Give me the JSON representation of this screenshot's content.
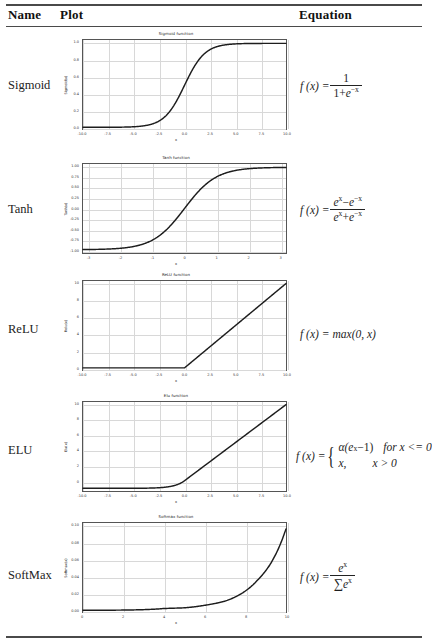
{
  "table": {
    "headers": {
      "name": "Name",
      "plot": "Plot",
      "equation": "Equation"
    }
  },
  "rows": [
    {
      "name": "Sigmoid",
      "equation_text": "f(x) = 1 / (1 + e^-x)",
      "chart": {
        "type": "line",
        "title": "Sigmoid function",
        "xlabel": "x",
        "ylabel": "Sigmoid(x)",
        "xlim": [
          -10,
          10
        ],
        "ylim": [
          -0.02,
          1.04
        ],
        "xticks": [
          "-10.0",
          "-7.5",
          "-5.0",
          "-2.5",
          "0.0",
          "2.5",
          "5.0",
          "7.5",
          "10.0"
        ],
        "xtickvals": [
          -10,
          -7.5,
          -5,
          -2.5,
          0,
          2.5,
          5,
          7.5,
          10
        ],
        "yticks": [
          "0.0",
          "0.2",
          "0.4",
          "0.6",
          "0.8",
          "1.0"
        ],
        "ytickvals": [
          0,
          0.2,
          0.4,
          0.6,
          0.8,
          1.0
        ],
        "grid": true,
        "legend": "none",
        "formula": "sigmoid",
        "points": [
          {
            "x": -10,
            "y": 4.54e-05
          },
          {
            "x": -8,
            "y": 0.000335
          },
          {
            "x": -6,
            "y": 0.00247
          },
          {
            "x": -5,
            "y": 0.00669
          },
          {
            "x": -4,
            "y": 0.01799
          },
          {
            "x": -3,
            "y": 0.04743
          },
          {
            "x": -2.5,
            "y": 0.07586
          },
          {
            "x": -2,
            "y": 0.1192
          },
          {
            "x": -1.5,
            "y": 0.18243
          },
          {
            "x": -1,
            "y": 0.26894
          },
          {
            "x": -0.5,
            "y": 0.37754
          },
          {
            "x": 0,
            "y": 0.5
          },
          {
            "x": 0.5,
            "y": 0.62246
          },
          {
            "x": 1,
            "y": 0.73106
          },
          {
            "x": 1.5,
            "y": 0.81757
          },
          {
            "x": 2,
            "y": 0.8808
          },
          {
            "x": 2.5,
            "y": 0.92414
          },
          {
            "x": 3,
            "y": 0.95257
          },
          {
            "x": 4,
            "y": 0.98201
          },
          {
            "x": 5,
            "y": 0.99331
          },
          {
            "x": 6,
            "y": 0.99753
          },
          {
            "x": 8,
            "y": 0.99966
          },
          {
            "x": 10,
            "y": 0.99995
          }
        ]
      }
    },
    {
      "name": "Tanh",
      "equation_text": "f(x) = (e^x - e^-x) / (e^x + e^-x)",
      "chart": {
        "type": "line",
        "title": "Tanh function",
        "xlabel": "x",
        "ylabel": "Tanh(x)",
        "xlim": [
          -3.2,
          3.2
        ],
        "ylim": [
          -1.08,
          1.08
        ],
        "xticks": [
          "-3",
          "-2",
          "-1",
          "0",
          "1",
          "2",
          "3"
        ],
        "xtickvals": [
          -3,
          -2,
          -1,
          0,
          1,
          2,
          3
        ],
        "yticks": [
          "-1.00",
          "-0.75",
          "-0.50",
          "-0.25",
          "0.00",
          "0.25",
          "0.50",
          "0.75",
          "1.00"
        ],
        "ytickvals": [
          -1,
          -0.75,
          -0.5,
          -0.25,
          0,
          0.25,
          0.5,
          0.75,
          1
        ],
        "grid": true,
        "legend": "none",
        "formula": "tanh",
        "points": [
          {
            "x": -3.2,
            "y": -0.99668
          },
          {
            "x": -3,
            "y": -0.99505
          },
          {
            "x": -2.5,
            "y": -0.98661
          },
          {
            "x": -2,
            "y": -0.96403
          },
          {
            "x": -1.5,
            "y": -0.90515
          },
          {
            "x": -1.25,
            "y": -0.84829
          },
          {
            "x": -1,
            "y": -0.76159
          },
          {
            "x": -0.75,
            "y": -0.63515
          },
          {
            "x": -0.5,
            "y": -0.46212
          },
          {
            "x": -0.25,
            "y": -0.24492
          },
          {
            "x": 0,
            "y": 0
          },
          {
            "x": 0.25,
            "y": 0.24492
          },
          {
            "x": 0.5,
            "y": 0.46212
          },
          {
            "x": 0.75,
            "y": 0.63515
          },
          {
            "x": 1,
            "y": 0.76159
          },
          {
            "x": 1.25,
            "y": 0.84829
          },
          {
            "x": 1.5,
            "y": 0.90515
          },
          {
            "x": 2,
            "y": 0.96403
          },
          {
            "x": 2.5,
            "y": 0.98661
          },
          {
            "x": 3,
            "y": 0.99505
          },
          {
            "x": 3.2,
            "y": 0.99668
          }
        ]
      }
    },
    {
      "name": "ReLU",
      "equation_text": "f(x) = max(0, x)",
      "chart": {
        "type": "line",
        "title": "ReLU function",
        "xlabel": "x",
        "ylabel": "Relu(x)",
        "xlim": [
          -10,
          10
        ],
        "ylim": [
          -0.25,
          10.3
        ],
        "xticks": [
          "-10.0",
          "-7.5",
          "-5.0",
          "-2.5",
          "0.0",
          "2.5",
          "5.0",
          "7.5",
          "10.0"
        ],
        "xtickvals": [
          -10,
          -7.5,
          -5,
          -2.5,
          0,
          2.5,
          5,
          7.5,
          10
        ],
        "yticks": [
          "0",
          "2",
          "4",
          "6",
          "8",
          "10"
        ],
        "ytickvals": [
          0,
          2,
          4,
          6,
          8,
          10
        ],
        "grid": true,
        "legend": "none",
        "formula": "relu",
        "points": [
          {
            "x": -10,
            "y": 0
          },
          {
            "x": -5,
            "y": 0
          },
          {
            "x": 0,
            "y": 0
          },
          {
            "x": 2.5,
            "y": 2.5
          },
          {
            "x": 5,
            "y": 5
          },
          {
            "x": 7.5,
            "y": 7.5
          },
          {
            "x": 10,
            "y": 10
          }
        ]
      }
    },
    {
      "name": "ELU",
      "equation_text": "f(x) = { alpha(e^x - 1) for x <= 0 ; x, for x > 0 }",
      "chart": {
        "type": "line",
        "title": "Elu function",
        "xlabel": "x",
        "ylabel": "Elu(x)",
        "xlim": [
          -10,
          10
        ],
        "ylim": [
          -1.35,
          10.35
        ],
        "xticks": [
          "-10.0",
          "-7.5",
          "-5.0",
          "-2.5",
          "0.0",
          "2.5",
          "5.0",
          "7.5",
          "10.0"
        ],
        "xtickvals": [
          -10,
          -7.5,
          -5,
          -2.5,
          0,
          2.5,
          5,
          7.5,
          10
        ],
        "yticks": [
          "0",
          "2",
          "4",
          "6",
          "8",
          "10"
        ],
        "ytickvals": [
          0,
          2,
          4,
          6,
          8,
          10
        ],
        "grid": true,
        "legend": "none",
        "formula": "elu",
        "points": [
          {
            "x": -10,
            "y": -0.99995
          },
          {
            "x": -7.5,
            "y": -0.99945
          },
          {
            "x": -5,
            "y": -0.99326
          },
          {
            "x": -4,
            "y": -0.98168
          },
          {
            "x": -3,
            "y": -0.95021
          },
          {
            "x": -2.5,
            "y": -0.91792
          },
          {
            "x": -2,
            "y": -0.86466
          },
          {
            "x": -1.5,
            "y": -0.77687
          },
          {
            "x": -1,
            "y": -0.63212
          },
          {
            "x": -0.5,
            "y": -0.39347
          },
          {
            "x": 0,
            "y": 0
          },
          {
            "x": 2.5,
            "y": 2.5
          },
          {
            "x": 5,
            "y": 5
          },
          {
            "x": 7.5,
            "y": 7.5
          },
          {
            "x": 10,
            "y": 10
          }
        ]
      }
    },
    {
      "name": "SoftMax",
      "equation_text": "f(x) = e^x / sum(e^x)",
      "chart": {
        "type": "line",
        "title": "Softmax function",
        "xlabel": "x",
        "ylabel": "Softmax(x)",
        "xlim": [
          0,
          10
        ],
        "ylim": [
          -0.002,
          0.104
        ],
        "xticks": [
          "0",
          "2",
          "4",
          "6",
          "8",
          "10"
        ],
        "xtickvals": [
          0,
          2,
          4,
          6,
          8,
          10
        ],
        "yticks": [
          "0.00",
          "0.02",
          "0.04",
          "0.06",
          "0.08",
          "0.10"
        ],
        "ytickvals": [
          0,
          0.02,
          0.04,
          0.06,
          0.08,
          0.1
        ],
        "grid": true,
        "legend": "none",
        "formula": "softmax",
        "points": [
          {
            "x": 0,
            "y": 4e-05
          },
          {
            "x": 1,
            "y": 0.00011
          },
          {
            "x": 2,
            "y": 0.0003
          },
          {
            "x": 3,
            "y": 0.00081
          },
          {
            "x": 4,
            "y": 0.0022
          },
          {
            "x": 5,
            "y": 0.00298
          },
          {
            "x": 6,
            "y": 0.006
          },
          {
            "x": 7,
            "y": 0.011
          },
          {
            "x": 8,
            "y": 0.023
          },
          {
            "x": 8.6,
            "y": 0.036
          },
          {
            "x": 9.2,
            "y": 0.054
          },
          {
            "x": 9.6,
            "y": 0.072
          },
          {
            "x": 10,
            "y": 0.097
          }
        ]
      }
    }
  ],
  "equations": {
    "sigmoid": {
      "lhs": "f (x) =",
      "num": "1",
      "den_pre": "1+",
      "den_e": "e",
      "den_exp": "−x"
    },
    "tanh": {
      "lhs": "f (x) =",
      "num_a": "e",
      "num_a_exp": "x",
      "num_op": "−",
      "num_b": "e",
      "num_b_exp": "−x",
      "den_a": "e",
      "den_a_exp": "x",
      "den_op": "+",
      "den_b": "e",
      "den_b_exp": "−x"
    },
    "relu": {
      "lhs": "f (x) =",
      "rhs": "max(0, x)"
    },
    "elu": {
      "lhs": "f (x) =",
      "line1": "α(e",
      "line1_exp": "x",
      "line1_end": "−1)",
      "cond1": "for x <= 0",
      "line2": "x,",
      "cond2": "x > 0"
    },
    "softmax": {
      "lhs": "f (x) =",
      "num": "e",
      "num_exp": "x",
      "den_sigma": "∑",
      "den_e": "e",
      "den_exp": "x"
    }
  }
}
